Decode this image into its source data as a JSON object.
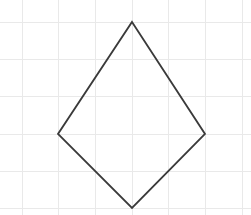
{
  "canvas": {
    "width": 251,
    "height": 215,
    "background_color": "#ffffff",
    "title": "Kite drawn on graph paper grid"
  },
  "grid": {
    "name": "graph-paper-grid",
    "line_color": "#e9e9e9",
    "line_width": 1,
    "spacing_px": 36.7,
    "vertical_x": [
      22,
      58.7,
      95.3,
      132,
      168.7,
      205.3,
      242
    ],
    "horizontal_y": [
      22,
      59.7,
      96.5,
      134,
      171,
      208
    ],
    "visible": true
  },
  "shape": {
    "name": "kite-quadrilateral",
    "type": "polygon",
    "sides": 4,
    "fill": "none",
    "stroke_color": "#3a3a3a",
    "stroke_width": 1.8,
    "points_string": "132,22 205,134 132,208 58,134",
    "vertices": [
      {
        "label": "top",
        "x": 132,
        "y": 22
      },
      {
        "label": "right",
        "x": 205,
        "y": 134
      },
      {
        "label": "bottom",
        "x": 132,
        "y": 208
      },
      {
        "label": "left",
        "x": 58,
        "y": 134
      }
    ]
  },
  "chart_data": {
    "type": "scatter",
    "title": "",
    "xlabel": "",
    "ylabel": "",
    "grid": true,
    "legend": null,
    "xlim": [
      0,
      251
    ],
    "ylim": [
      0,
      215
    ],
    "annotations": [],
    "series": [
      {
        "name": "kite-outline",
        "closed": true,
        "x": [
          132,
          205,
          132,
          58
        ],
        "y": [
          22,
          134,
          208,
          134
        ]
      }
    ]
  }
}
